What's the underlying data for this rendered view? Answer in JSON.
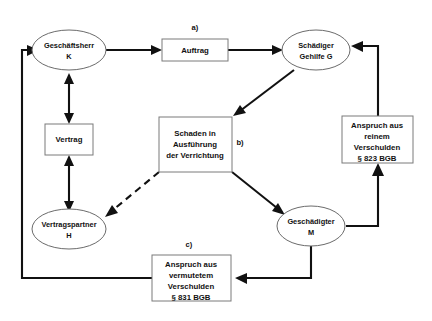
{
  "diagram": {
    "nodes": [
      {
        "id": "geschaeftsherr",
        "type": "ellipse",
        "line1": "Geschäftsherr",
        "line2": "K"
      },
      {
        "id": "schaediger",
        "type": "ellipse",
        "line1": "Schädiger",
        "line2": "Gehilfe G"
      },
      {
        "id": "vertragspartner",
        "type": "ellipse",
        "line1": "Vertragspartner",
        "line2": "H"
      },
      {
        "id": "geschaedigter",
        "type": "ellipse",
        "line1": "Geschädigter",
        "line2": "M"
      }
    ],
    "boxes": [
      {
        "id": "auftrag",
        "lines": [
          "Auftrag"
        ]
      },
      {
        "id": "vertrag",
        "lines": [
          "Vertrag"
        ]
      },
      {
        "id": "schaden",
        "lines": [
          "Schaden in",
          "Ausführung",
          "der Verrichtung"
        ]
      },
      {
        "id": "anspruch-823",
        "lines": [
          "Anspruch aus",
          "reinem",
          "Verschulden",
          "§ 823 BGB"
        ]
      },
      {
        "id": "anspruch-831",
        "lines": [
          "Anspruch aus",
          "vermutetem",
          "Verschulden",
          "§ 831 BGB"
        ]
      }
    ],
    "step_labels": [
      {
        "id": "step-a",
        "text": "a)"
      },
      {
        "id": "step-b",
        "text": "b)"
      },
      {
        "id": "step-c",
        "text": "c)"
      }
    ],
    "colors": {
      "background": "#ffffff",
      "edge": "#111111",
      "node_stroke": "#6b6b6b",
      "box_stroke": "#7a7a7a",
      "text": "#111111"
    }
  }
}
